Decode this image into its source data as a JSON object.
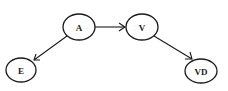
{
  "diagram": {
    "type": "directed-graph",
    "nodes": [
      {
        "id": "A",
        "label": "A"
      },
      {
        "id": "V",
        "label": "V"
      },
      {
        "id": "E",
        "label": "E"
      },
      {
        "id": "VD",
        "label": "VD"
      }
    ],
    "edges": [
      {
        "from": "A",
        "to": "V"
      },
      {
        "from": "A",
        "to": "E"
      },
      {
        "from": "V",
        "to": "VD"
      }
    ],
    "colors": {
      "stroke": "#1a1a1a",
      "background": "#ffffff"
    }
  }
}
